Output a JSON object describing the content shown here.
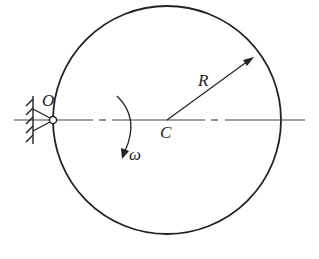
{
  "diagram": {
    "labels": {
      "pivot": "O",
      "center": "C",
      "radius": "R",
      "angular_velocity": "ω"
    },
    "colors": {
      "stroke": "#222222",
      "background": "#ffffff"
    }
  }
}
